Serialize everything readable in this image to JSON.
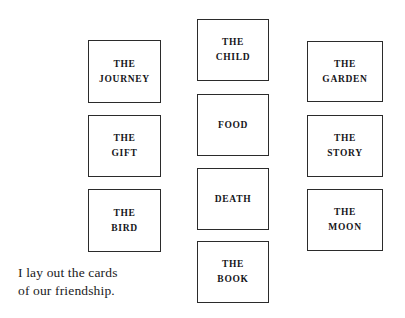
{
  "page": {
    "background_color": "#ffffff",
    "card_border_color": "#2b2b2b",
    "text_color": "#16161a",
    "width": 405,
    "height": 318
  },
  "spread": {
    "columns": [
      {
        "name": "left-column",
        "cards": [
          {
            "label": "THE\nJOURNEY",
            "x": 88,
            "y": 40,
            "w": 73,
            "h": 63
          },
          {
            "label": "THE\nGIFT",
            "x": 88,
            "y": 115,
            "w": 73,
            "h": 62
          },
          {
            "label": "THE\nBIRD",
            "x": 88,
            "y": 189,
            "w": 73,
            "h": 63
          }
        ]
      },
      {
        "name": "center-column",
        "cards": [
          {
            "label": "THE\nCHILD",
            "x": 197,
            "y": 19,
            "w": 72,
            "h": 62
          },
          {
            "label": "FOOD",
            "x": 197,
            "y": 94,
            "w": 72,
            "h": 62
          },
          {
            "label": "DEATH",
            "x": 197,
            "y": 168,
            "w": 72,
            "h": 62
          },
          {
            "label": "THE\nBOOK",
            "x": 197,
            "y": 241,
            "w": 72,
            "h": 62
          }
        ]
      },
      {
        "name": "right-column",
        "cards": [
          {
            "label": "THE\nGARDEN",
            "x": 307,
            "y": 41,
            "w": 76,
            "h": 61
          },
          {
            "label": "THE\nSTORY",
            "x": 307,
            "y": 115,
            "w": 76,
            "h": 62
          },
          {
            "label": "THE\nMOON",
            "x": 307,
            "y": 189,
            "w": 76,
            "h": 62
          }
        ]
      }
    ]
  },
  "caption": {
    "text": "I lay out the cards\nof our friendship.",
    "x": 18,
    "y": 264
  }
}
